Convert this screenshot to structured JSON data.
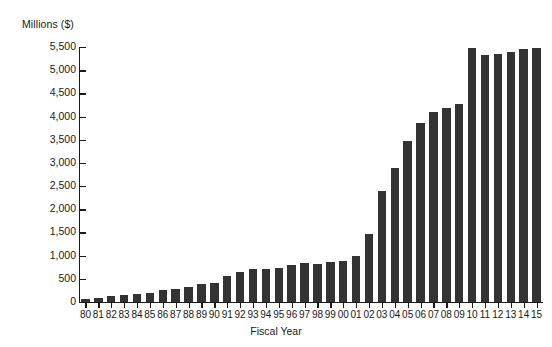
{
  "chart_data": {
    "type": "bar",
    "title": "",
    "subtitle": "",
    "ylabel": "Millions ($)",
    "xlabel": "Fiscal Year",
    "ylim": [
      0,
      5500
    ],
    "ytick_labels": [
      "5,500",
      "5,000",
      "4,500",
      "4,000",
      "3,500",
      "3,000",
      "2,500",
      "2,000",
      "1,500",
      "1,000",
      "500",
      "0"
    ],
    "ytick_values": [
      5500,
      5000,
      4500,
      4000,
      3500,
      3000,
      2500,
      2000,
      1500,
      1000,
      500,
      0
    ],
    "grid": false,
    "legend": null,
    "bar_color": "#333333",
    "axis_color": "#1a1a1a",
    "background_color": "#ffffff",
    "categories": [
      "80",
      "81",
      "82",
      "83",
      "84",
      "85",
      "86",
      "87",
      "88",
      "89",
      "90",
      "91",
      "92",
      "93",
      "94",
      "95",
      "96",
      "97",
      "98",
      "99",
      "00",
      "01",
      "02",
      "03",
      "04",
      "05",
      "06",
      "07",
      "08",
      "09",
      "10",
      "11",
      "12",
      "13",
      "14",
      "15"
    ],
    "values": [
      60,
      80,
      120,
      160,
      180,
      200,
      265,
      280,
      330,
      390,
      410,
      570,
      655,
      720,
      715,
      740,
      795,
      840,
      820,
      860,
      880,
      1000,
      1470,
      2390,
      2880,
      3480,
      3870,
      4100,
      4180,
      4270,
      5470,
      5330,
      5350,
      5390,
      5450,
      5480
    ],
    "series": [
      {
        "name": "Amount",
        "values": [
          60,
          80,
          120,
          160,
          180,
          200,
          265,
          280,
          330,
          390,
          410,
          570,
          655,
          720,
          715,
          740,
          795,
          840,
          820,
          860,
          880,
          1000,
          1470,
          2390,
          2880,
          3480,
          3870,
          4100,
          4180,
          4270,
          5470,
          5330,
          5350,
          5390,
          5450,
          5480
        ]
      }
    ]
  }
}
